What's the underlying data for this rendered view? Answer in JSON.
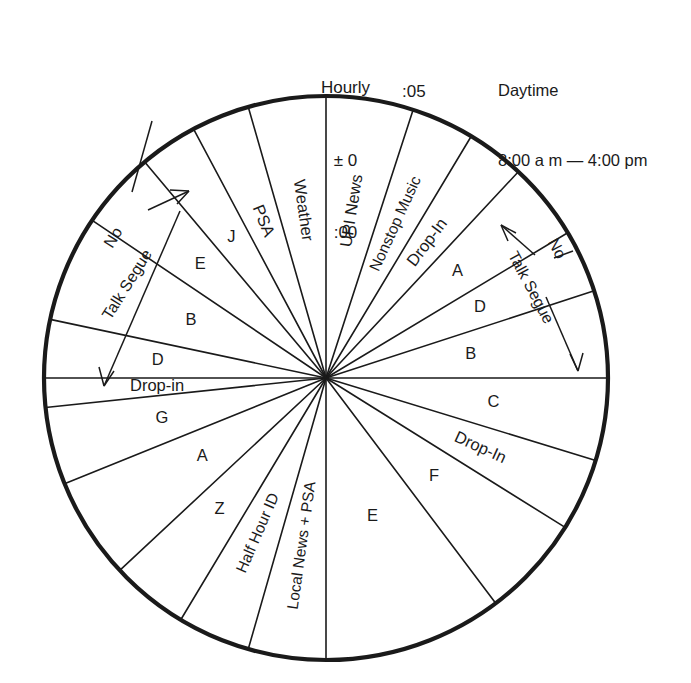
{
  "header": {
    "hourly_title": "Hourly",
    "hourly_tolerance": "± 0",
    "hourly_mark": ":00",
    "tick_05": ":05",
    "daytime_title": "Daytime",
    "daytime_hours": "8:00 a m — 4:00 pm"
  },
  "annotations": {
    "left": {
      "line1": "No",
      "line2": "Talk Segue"
    },
    "right": {
      "line1": "No",
      "line2": "Talk Segue"
    }
  },
  "wheel": {
    "center_x": 326,
    "center_y": 378,
    "radius": 282,
    "segments": [
      {
        "id": "upi-news",
        "label": "UPI News",
        "start_deg": 0,
        "end_deg": 18,
        "orient": "radial"
      },
      {
        "id": "nonstop-music",
        "label": "Nonstop Music",
        "start_deg": 18,
        "end_deg": 31,
        "orient": "radial"
      },
      {
        "id": "drop-in-top",
        "label": "Drop-In",
        "start_deg": 31,
        "end_deg": 43,
        "orient": "radial"
      },
      {
        "id": "a-top-right",
        "label": "A",
        "start_deg": 43,
        "end_deg": 59,
        "orient": "upright"
      },
      {
        "id": "d-top-right",
        "label": "D",
        "start_deg": 59,
        "end_deg": 72,
        "orient": "upright"
      },
      {
        "id": "b-top-right",
        "label": "B",
        "start_deg": 72,
        "end_deg": 90,
        "orient": "upright"
      },
      {
        "id": "c-right",
        "label": "C",
        "start_deg": 90,
        "end_deg": 107,
        "orient": "upright"
      },
      {
        "id": "drop-in-right",
        "label": "Drop-In",
        "start_deg": 107,
        "end_deg": 122,
        "orient": "radial"
      },
      {
        "id": "f-bottom-right",
        "label": "F",
        "start_deg": 122,
        "end_deg": 143,
        "orient": "upright"
      },
      {
        "id": "e-bottom-right",
        "label": "E",
        "start_deg": 143,
        "end_deg": 180,
        "orient": "upright"
      },
      {
        "id": "local-news-psa",
        "label": "Local News + PSA",
        "start_deg": 180,
        "end_deg": 196,
        "orient": "radial"
      },
      {
        "id": "half-hour-id",
        "label": "Half Hour ID",
        "start_deg": 196,
        "end_deg": 211,
        "orient": "radial"
      },
      {
        "id": "z-bottom-left",
        "label": "Z",
        "start_deg": 211,
        "end_deg": 227,
        "orient": "upright"
      },
      {
        "id": "a-bottom-left",
        "label": "A",
        "start_deg": 227,
        "end_deg": 248,
        "orient": "upright"
      },
      {
        "id": "g-left",
        "label": "G",
        "start_deg": 248,
        "end_deg": 264,
        "orient": "upright"
      },
      {
        "id": "drop-in-left",
        "label": "Drop-in",
        "start_deg": 264,
        "end_deg": 270,
        "orient": "upright"
      },
      {
        "id": "d-top-left",
        "label": "D",
        "start_deg": 270,
        "end_deg": 282,
        "orient": "upright"
      },
      {
        "id": "b-top-left",
        "label": "B",
        "start_deg": 282,
        "end_deg": 304,
        "orient": "upright"
      },
      {
        "id": "e-top-left",
        "label": "E",
        "start_deg": 304,
        "end_deg": 320,
        "orient": "upright"
      },
      {
        "id": "j-top-left",
        "label": "J",
        "start_deg": 320,
        "end_deg": 332,
        "orient": "upright"
      },
      {
        "id": "psa-top-left",
        "label": "PSA",
        "start_deg": 332,
        "end_deg": 344,
        "orient": "radial"
      },
      {
        "id": "weather-top-left",
        "label": "Weather",
        "start_deg": 344,
        "end_deg": 360,
        "orient": "radial"
      }
    ]
  },
  "colors": {
    "ink": "#1a1a1a",
    "paper": "#ffffff"
  }
}
